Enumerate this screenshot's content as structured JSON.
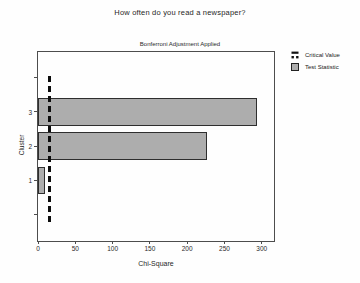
{
  "chart_data": {
    "type": "bar",
    "orientation": "horizontal",
    "title": "How often do you read a newspaper?",
    "subtitle": "Bonferroni Adjustment Applied",
    "xlabel": "Chi-Square",
    "ylabel": "Cluster",
    "categories": [
      1,
      2,
      3
    ],
    "series": [
      {
        "name": "Test Statistic",
        "type": "bar",
        "values": [
          9.5,
          226,
          293
        ]
      }
    ],
    "reference_line": {
      "name": "Critical Value",
      "value": 16,
      "orientation": "vertical",
      "style": "dashed",
      "span": [
        -0.28,
        4.05
      ]
    },
    "xlim": [
      0,
      319
    ],
    "x_ticks": [
      0,
      50,
      100,
      150,
      200,
      250,
      300
    ],
    "ylim": [
      -0.83,
      4.75
    ],
    "y_ticks": [
      0,
      1,
      2,
      3,
      4
    ],
    "y_tick_labels": [
      "",
      "1",
      "2",
      "3",
      ""
    ],
    "bar_height": 0.8,
    "grid": false,
    "legend_position": "top-right",
    "legend": [
      {
        "label": "Critical Value",
        "marker": "dashed-line"
      },
      {
        "label": "Test Statistic",
        "marker": "filled-square"
      }
    ],
    "colors": {
      "bar_fill": "#adadad",
      "bar_border": "#2e2e2e",
      "critical_line": "#0d0d0d",
      "frame": "#4d4d4d",
      "text": "#1f1f1f",
      "background": "#fefefe"
    }
  }
}
